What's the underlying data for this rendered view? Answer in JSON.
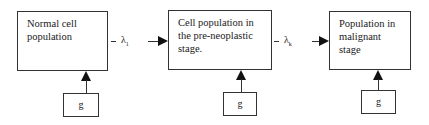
{
  "diagram": {
    "stages": [
      {
        "label_line1": "Normal cell",
        "label_line2": "population",
        "label_line3": ""
      },
      {
        "label_line1": "Cell population in",
        "label_line2": "the pre-neoplastic",
        "label_line3": "stage."
      },
      {
        "label_line1": "Population in",
        "label_line2": "malignant",
        "label_line3": "stage"
      }
    ],
    "inputs": [
      {
        "label": "g"
      },
      {
        "label": "g"
      },
      {
        "label": "g"
      }
    ],
    "transitions": [
      {
        "symbol": "λ",
        "subscript": "1"
      },
      {
        "symbol": "λ",
        "subscript": "k"
      }
    ]
  }
}
